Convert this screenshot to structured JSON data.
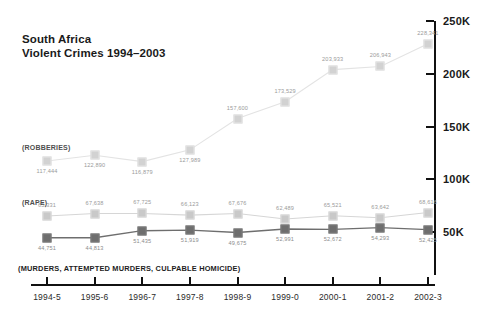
{
  "chart_data": {
    "type": "line",
    "title": "South Africa Violent Crimes 1994–2003",
    "title_lines": [
      "South Africa",
      "Violent Crimes 1994–2003"
    ],
    "xlabel": "",
    "ylabel": "",
    "ylim": [
      0,
      250000
    ],
    "grid": false,
    "legend_position": "inline",
    "categories": [
      "1994-5",
      "1995-6",
      "1996-7",
      "1997-8",
      "1998-9",
      "1999-0",
      "2000-1",
      "2001-2",
      "2002-3"
    ],
    "ytick_labels": [
      "50K",
      "100K",
      "150K",
      "200K",
      "250K"
    ],
    "ytick_values": [
      50000,
      100000,
      150000,
      200000,
      250000
    ],
    "series": [
      {
        "name": "(ROBBERIES)",
        "caption": "(ROBBERIES)",
        "color": "#d2d2d2",
        "values": [
          117444,
          122890,
          116879,
          127989,
          157600,
          173529,
          203933,
          206943,
          228341
        ],
        "labels": [
          "117,444",
          "122,890",
          "116,879",
          "127,989",
          "157,600",
          "173,529",
          "203,933",
          "206,943",
          "228,341"
        ]
      },
      {
        "name": "(RAPE)",
        "caption": "(RAPE)",
        "color": "#c9c9c9",
        "values": [
          65331,
          67638,
          67725,
          66123,
          67676,
          62489,
          65521,
          63642,
          68616
        ],
        "labels": [
          "65,331",
          "67,638",
          "67,725",
          "66,123",
          "67,676",
          "62,489",
          "65,521",
          "63,642",
          "68,616"
        ]
      },
      {
        "name": "(MURDERS, ATTEMPTED MURDERS, CULPABLE HOMICIDE)",
        "caption": "(MURDERS, ATTEMPTED MURDERS, CULPABLE HOMICIDE)",
        "color": "#6e6e6e",
        "values": [
          44751,
          44813,
          51435,
          51919,
          49675,
          52991,
          52672,
          54293,
          52425
        ],
        "labels": [
          "44,751",
          "44,813",
          "51,435",
          "51,919",
          "49,675",
          "52,991",
          "52,672",
          "54,293",
          "52,425"
        ]
      }
    ]
  }
}
